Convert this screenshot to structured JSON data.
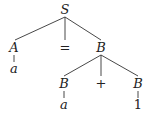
{
  "diagram": {
    "type": "parse-tree",
    "nodes": [
      {
        "id": "S",
        "label": "S",
        "italic": true,
        "x": 65,
        "y": 14
      },
      {
        "id": "A",
        "label": "A",
        "italic": true,
        "x": 14,
        "y": 52
      },
      {
        "id": "eq",
        "label": "=",
        "italic": false,
        "x": 65,
        "y": 52
      },
      {
        "id": "B1",
        "label": "B",
        "italic": true,
        "x": 101,
        "y": 52
      },
      {
        "id": "a1",
        "label": "a",
        "italic": true,
        "x": 14,
        "y": 73
      },
      {
        "id": "B2",
        "label": "B",
        "italic": true,
        "x": 64,
        "y": 88
      },
      {
        "id": "plus",
        "label": "+",
        "italic": false,
        "x": 101,
        "y": 88
      },
      {
        "id": "B3",
        "label": "B",
        "italic": true,
        "x": 138,
        "y": 88
      },
      {
        "id": "a2",
        "label": "a",
        "italic": true,
        "x": 64,
        "y": 109
      },
      {
        "id": "one",
        "label": "1",
        "italic": false,
        "x": 138,
        "y": 109
      }
    ],
    "edges": [
      {
        "from": "S",
        "to": "A",
        "x1": 65,
        "y1": 17,
        "x2": 15,
        "y2": 40
      },
      {
        "from": "S",
        "to": "eq",
        "x1": 65,
        "y1": 17,
        "x2": 65,
        "y2": 40
      },
      {
        "from": "S",
        "to": "B1",
        "x1": 65,
        "y1": 17,
        "x2": 101,
        "y2": 40
      },
      {
        "from": "A",
        "to": "a1",
        "x1": 14,
        "y1": 55,
        "x2": 14,
        "y2": 62
      },
      {
        "from": "B1",
        "to": "B2",
        "x1": 101,
        "y1": 55,
        "x2": 64,
        "y2": 76
      },
      {
        "from": "B1",
        "to": "plus",
        "x1": 101,
        "y1": 55,
        "x2": 101,
        "y2": 76
      },
      {
        "from": "B1",
        "to": "B3",
        "x1": 101,
        "y1": 55,
        "x2": 138,
        "y2": 76
      },
      {
        "from": "B2",
        "to": "a2",
        "x1": 64,
        "y1": 91,
        "x2": 64,
        "y2": 98
      },
      {
        "from": "B3",
        "to": "one",
        "x1": 138,
        "y1": 91,
        "x2": 138,
        "y2": 98
      }
    ]
  }
}
